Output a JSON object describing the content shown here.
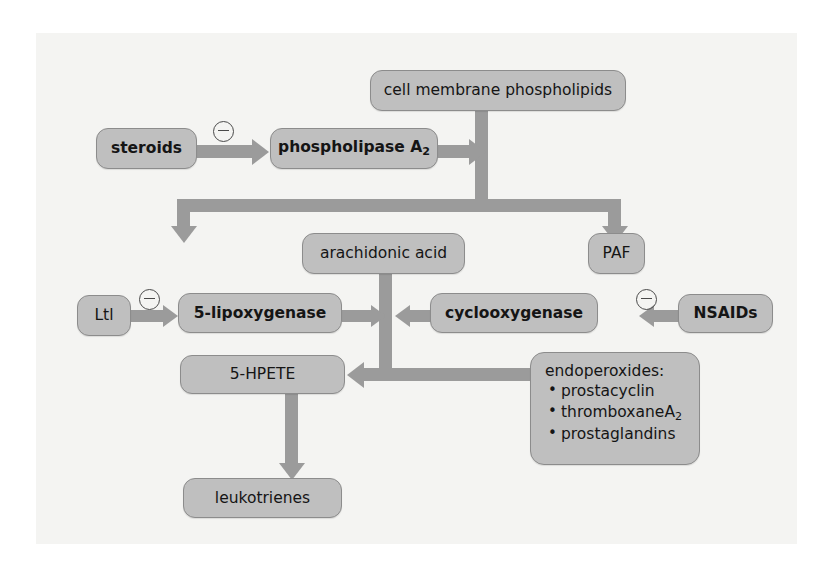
{
  "figure": {
    "background_color": "#f4f4f2",
    "node_fill": "#bfbfbf",
    "node_border": "#8c8c8c",
    "arrow_color": "#9b9b9b",
    "text_color": "#151515"
  },
  "nodes": {
    "cell_membrane": "cell membrane phospholipids",
    "steroids": "steroids",
    "phospholipase": "phospholipase A",
    "phospholipase_sub": "2",
    "arachidonic": "arachidonic acid",
    "paf": "PAF",
    "ltl": "Ltl",
    "lipoxygenase": "5-lipoxygenase",
    "cyclooxygenase": "cyclooxygenase",
    "nsaids": "NSAIDs",
    "hpete": "5-HPETE",
    "leukotrienes": "leukotrienes",
    "endoperoxides_header": "endoperoxides:",
    "endoperoxides_items": [
      {
        "text": "prostacyclin",
        "sub": ""
      },
      {
        "text": "thromboxaneA",
        "sub": "2"
      },
      {
        "text": "prostaglandins",
        "sub": ""
      }
    ]
  },
  "inhibitors": [
    {
      "name": "steroids-inhibits-phospholipase",
      "symbol": "⊖"
    },
    {
      "name": "ltl-inhibits-5-lipoxygenase",
      "symbol": "⊖"
    },
    {
      "name": "nsaids-inhibits-cyclooxygenase",
      "symbol": "⊖"
    }
  ],
  "arrows": [
    {
      "name": "steroids-to-phospholipase",
      "direction": "right"
    },
    {
      "name": "phospholipase-to-membrane-junction",
      "direction": "right"
    },
    {
      "name": "membrane-down-trunk",
      "direction": "down"
    },
    {
      "name": "junction-to-arachidonic",
      "direction": "down"
    },
    {
      "name": "junction-to-paf",
      "direction": "down"
    },
    {
      "name": "ltl-to-lipoxygenase",
      "direction": "right"
    },
    {
      "name": "lipoxygenase-to-center",
      "direction": "right"
    },
    {
      "name": "cyclooxygenase-to-center",
      "direction": "left"
    },
    {
      "name": "nsaids-to-cyclooxygenase",
      "direction": "left"
    },
    {
      "name": "arachidonic-down-trunk",
      "direction": "down"
    },
    {
      "name": "center-to-hpete",
      "direction": "left"
    },
    {
      "name": "center-to-endoperoxides",
      "direction": "right"
    },
    {
      "name": "hpete-to-leukotrienes",
      "direction": "down"
    }
  ]
}
